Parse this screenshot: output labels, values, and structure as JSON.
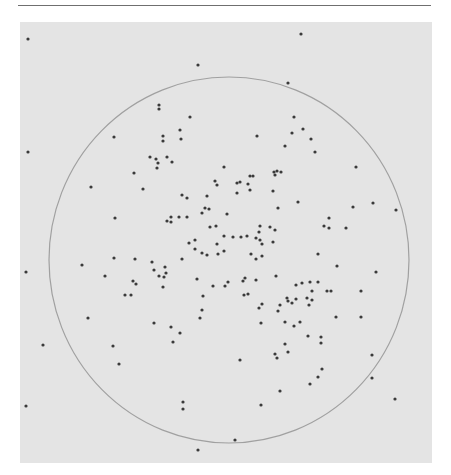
{
  "figure": {
    "background_color": "#e4e4e4",
    "dot_color": "#3a3a3a",
    "circle_color": "#8a8a8a",
    "circle": {
      "cx": 229,
      "cy": 260,
      "rx": 180,
      "ry": 183
    },
    "dots": [
      [
        28,
        39
      ],
      [
        301,
        34
      ],
      [
        198,
        65
      ],
      [
        288,
        83
      ],
      [
        159,
        105
      ],
      [
        159,
        109
      ],
      [
        190,
        117
      ],
      [
        294,
        117
      ],
      [
        114,
        137
      ],
      [
        163,
        136
      ],
      [
        163,
        141
      ],
      [
        180,
        130
      ],
      [
        181,
        139
      ],
      [
        257,
        136
      ],
      [
        292,
        133
      ],
      [
        303,
        129
      ],
      [
        285,
        146
      ],
      [
        311,
        139
      ],
      [
        315,
        152
      ],
      [
        28,
        152
      ],
      [
        150,
        157
      ],
      [
        156,
        159
      ],
      [
        158,
        163
      ],
      [
        167,
        157
      ],
      [
        172,
        162
      ],
      [
        157,
        168
      ],
      [
        224,
        167
      ],
      [
        356,
        167
      ],
      [
        274,
        172
      ],
      [
        277,
        171
      ],
      [
        281,
        172
      ],
      [
        275,
        175
      ],
      [
        250,
        176
      ],
      [
        253,
        176
      ],
      [
        134,
        173
      ],
      [
        215,
        181
      ],
      [
        217,
        185
      ],
      [
        237,
        183
      ],
      [
        240,
        182
      ],
      [
        248,
        184
      ],
      [
        91,
        187
      ],
      [
        143,
        189
      ],
      [
        250,
        190
      ],
      [
        237,
        193
      ],
      [
        273,
        191
      ],
      [
        182,
        195
      ],
      [
        187,
        198
      ],
      [
        207,
        196
      ],
      [
        298,
        202
      ],
      [
        278,
        208
      ],
      [
        353,
        207
      ],
      [
        373,
        203
      ],
      [
        396,
        210
      ],
      [
        202,
        213
      ],
      [
        205,
        208
      ],
      [
        209,
        209
      ],
      [
        227,
        214
      ],
      [
        115,
        218
      ],
      [
        167,
        221
      ],
      [
        171,
        217
      ],
      [
        179,
        217
      ],
      [
        171,
        222
      ],
      [
        187,
        217
      ],
      [
        329,
        218
      ],
      [
        324,
        226
      ],
      [
        329,
        228
      ],
      [
        346,
        228
      ],
      [
        260,
        226
      ],
      [
        270,
        227
      ],
      [
        275,
        230
      ],
      [
        259,
        232
      ],
      [
        210,
        227
      ],
      [
        216,
        226
      ],
      [
        224,
        236
      ],
      [
        233,
        237
      ],
      [
        241,
        237
      ],
      [
        247,
        236
      ],
      [
        256,
        238
      ],
      [
        262,
        244
      ],
      [
        260,
        240
      ],
      [
        273,
        242
      ],
      [
        189,
        243
      ],
      [
        195,
        240
      ],
      [
        195,
        249
      ],
      [
        202,
        253
      ],
      [
        207,
        255
      ],
      [
        217,
        244
      ],
      [
        218,
        254
      ],
      [
        224,
        251
      ],
      [
        318,
        254
      ],
      [
        251,
        254
      ],
      [
        256,
        259
      ],
      [
        262,
        256
      ],
      [
        114,
        258
      ],
      [
        135,
        259
      ],
      [
        152,
        262
      ],
      [
        182,
        259
      ],
      [
        82,
        265
      ],
      [
        26,
        272
      ],
      [
        154,
        270
      ],
      [
        166,
        273
      ],
      [
        165,
        267
      ],
      [
        159,
        276
      ],
      [
        164,
        277
      ],
      [
        105,
        276
      ],
      [
        337,
        266
      ],
      [
        376,
        272
      ],
      [
        276,
        276
      ],
      [
        133,
        281
      ],
      [
        136,
        284
      ],
      [
        197,
        279
      ],
      [
        228,
        282
      ],
      [
        213,
        286
      ],
      [
        225,
        286
      ],
      [
        243,
        281
      ],
      [
        245,
        278
      ],
      [
        256,
        280
      ],
      [
        163,
        287
      ],
      [
        296,
        285
      ],
      [
        310,
        282
      ],
      [
        302,
        283
      ],
      [
        318,
        282
      ],
      [
        312,
        291
      ],
      [
        327,
        291
      ],
      [
        331,
        291
      ],
      [
        361,
        291
      ],
      [
        125,
        295
      ],
      [
        131,
        295
      ],
      [
        203,
        296
      ],
      [
        244,
        295
      ],
      [
        248,
        294
      ],
      [
        296,
        299
      ],
      [
        287,
        298
      ],
      [
        307,
        298
      ],
      [
        262,
        304
      ],
      [
        278,
        311
      ],
      [
        292,
        303
      ],
      [
        259,
        308
      ],
      [
        280,
        305
      ],
      [
        288,
        301
      ],
      [
        309,
        305
      ],
      [
        312,
        300
      ],
      [
        202,
        310
      ],
      [
        200,
        318
      ],
      [
        88,
        318
      ],
      [
        154,
        323
      ],
      [
        171,
        327
      ],
      [
        180,
        333
      ],
      [
        173,
        342
      ],
      [
        336,
        317
      ],
      [
        361,
        317
      ],
      [
        261,
        323
      ],
      [
        285,
        322
      ],
      [
        294,
        326
      ],
      [
        300,
        322
      ],
      [
        308,
        336
      ],
      [
        321,
        337
      ],
      [
        321,
        343
      ],
      [
        43,
        345
      ],
      [
        113,
        346
      ],
      [
        285,
        344
      ],
      [
        275,
        354
      ],
      [
        277,
        358
      ],
      [
        288,
        352
      ],
      [
        240,
        360
      ],
      [
        372,
        355
      ],
      [
        119,
        364
      ],
      [
        322,
        369
      ],
      [
        318,
        377
      ],
      [
        310,
        384
      ],
      [
        372,
        378
      ],
      [
        280,
        391
      ],
      [
        395,
        399
      ],
      [
        183,
        402
      ],
      [
        183,
        409
      ],
      [
        261,
        405
      ],
      [
        26,
        406
      ],
      [
        235,
        440
      ],
      [
        198,
        450
      ]
    ]
  }
}
